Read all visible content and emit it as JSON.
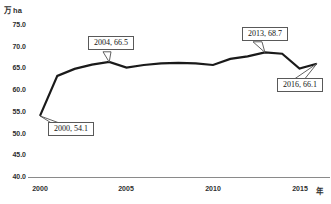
{
  "chart_data": {
    "type": "line",
    "title": "",
    "unit_label": "万 ha",
    "x_axis_suffix_label": "年",
    "x": [
      2000,
      2001,
      2002,
      2003,
      2004,
      2005,
      2006,
      2007,
      2008,
      2009,
      2010,
      2011,
      2012,
      2013,
      2014,
      2015,
      2016
    ],
    "values": [
      54.1,
      63.3,
      64.9,
      65.9,
      66.5,
      65.2,
      65.8,
      66.2,
      66.3,
      66.2,
      65.8,
      67.2,
      67.8,
      68.7,
      68.4,
      65.0,
      66.1
    ],
    "ylim": [
      40,
      75
    ],
    "ytick_step": 5,
    "ytick_labels": [
      "75.0",
      "70.0",
      "65.0",
      "60.0",
      "55.0",
      "50.0",
      "45.0",
      "40.0"
    ],
    "xtick_labels": [
      "2000",
      "2005",
      "2010",
      "2015"
    ],
    "grid": false,
    "legend": "none",
    "line_color": "#1a1a1a",
    "axis_color": "#8a8a8a",
    "annotations": [
      {
        "label": "2000, 54.1",
        "x": 2000,
        "y": 54.1
      },
      {
        "label": "2004, 66.5",
        "x": 2004,
        "y": 66.5
      },
      {
        "label": "2013, 68.7",
        "x": 2013,
        "y": 68.7
      },
      {
        "label": "2016, 66.1",
        "x": 2016,
        "y": 66.1
      }
    ]
  }
}
